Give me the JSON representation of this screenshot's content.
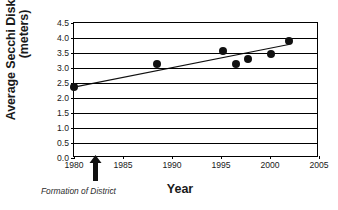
{
  "chart_data": {
    "type": "scatter",
    "title": "",
    "xlabel": "Year",
    "ylabel_line1": "Average Secchi Disk Reading",
    "ylabel_line2": "(meters)",
    "xlim": [
      1980,
      2005
    ],
    "ylim": [
      0.0,
      4.5
    ],
    "xticks": [
      1980,
      1985,
      1990,
      1995,
      2000,
      2005
    ],
    "xticklabels": [
      "1980",
      "1985",
      "1990",
      "1995",
      "2000",
      "2005"
    ],
    "yticks": [
      0.0,
      0.5,
      1.0,
      1.5,
      2.0,
      2.5,
      3.0,
      3.5,
      4.0,
      4.5
    ],
    "yticklabels": [
      "0.0",
      "0.5",
      "1.0",
      "1.5",
      "2.0",
      "2.5",
      "3.0",
      "3.5",
      "4.0",
      "4.5"
    ],
    "grid": "horizontal",
    "legend": "none",
    "points": [
      {
        "x": 1980.0,
        "y": 2.37
      },
      {
        "x": 1988.5,
        "y": 3.13
      },
      {
        "x": 1995.2,
        "y": 3.57
      },
      {
        "x": 1996.5,
        "y": 3.13
      },
      {
        "x": 1997.8,
        "y": 3.3
      },
      {
        "x": 2000.1,
        "y": 3.47
      },
      {
        "x": 2001.9,
        "y": 3.9
      }
    ],
    "trendline": {
      "label": "linear trend",
      "x0": 1980.0,
      "y0": 2.33,
      "x1": 2002.1,
      "y1": 3.77
    },
    "annotations": [
      {
        "name": "formation-of-district",
        "label": "Formation of District",
        "x": 1982.3,
        "marker": "up-arrow"
      }
    ]
  }
}
